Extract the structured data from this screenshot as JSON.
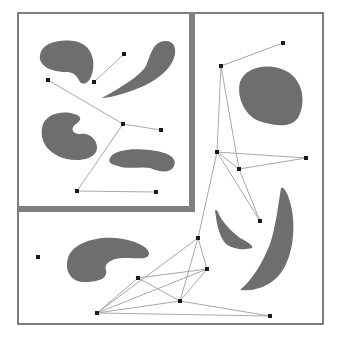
{
  "diagram": {
    "type": "probabilistic-roadmap",
    "colors": {
      "background": "#ffffff",
      "frame": "#555555",
      "inset_frame": "#808080",
      "obstacle": "#6e6e6e",
      "edge": "#a8a8a8",
      "node": "#1a1a1a"
    },
    "outer_frame": {
      "x": 18,
      "y": 13,
      "width": 305,
      "height": 311
    },
    "inset_frame": {
      "x": 18,
      "y": 13,
      "width": 171,
      "height": 193,
      "thickness": 6
    },
    "obstacles": [
      {
        "name": "inset-blob-top-left",
        "d": "M40,55 C42,42 62,38 78,42 C92,46 96,62 92,74 C90,82 84,86 80,82 C76,74 72,72 66,72 C52,72 38,66 40,55 Z"
      },
      {
        "name": "inset-feather",
        "d": "M102,98 C120,88 140,76 146,66 C150,56 152,46 160,42 C172,38 178,46 174,58 C168,74 150,84 134,90 C122,94 110,98 102,98 Z"
      },
      {
        "name": "inset-bean-left",
        "d": "M42,128 C44,114 62,110 74,114 C82,116 82,120 76,124 C70,128 72,134 80,134 C92,132 100,144 96,152 C90,162 70,162 58,156 C46,150 40,140 42,128 Z"
      },
      {
        "name": "inset-bean-right",
        "d": "M110,158 C114,150 132,148 150,150 C168,152 178,158 174,166 C170,174 160,172 150,168 C140,166 128,170 118,166 C110,164 108,162 110,158 Z"
      },
      {
        "name": "upper-right-egg",
        "d": "M240,82 C246,66 270,62 288,72 C304,82 306,104 298,118 C290,128 276,126 262,122 C246,118 236,98 240,82 Z"
      },
      {
        "name": "lower-left-kidney",
        "d": "M68,258 C72,244 94,236 116,238 C136,240 150,248 149,254 C148,260 138,258 126,258 C110,258 104,264 106,270 C108,280 96,282 84,282 C72,282 64,272 68,258 Z"
      },
      {
        "name": "small-crescent",
        "d": "M215,210 C216,218 218,236 226,244 C234,250 246,250 252,248 C254,246 248,242 240,238 C230,230 222,222 218,212 C217,210 216,210 215,210 Z"
      },
      {
        "name": "large-crescent",
        "d": "M281,188 C278,206 276,226 270,244 C262,264 252,280 240,290 C254,292 274,286 284,268 C294,250 296,222 290,202 C288,194 284,186 281,188 Z"
      }
    ],
    "nodes": [
      {
        "id": "n1",
        "x": 124,
        "y": 54
      },
      {
        "id": "n2",
        "x": 94,
        "y": 82
      },
      {
        "id": "n3",
        "x": 48,
        "y": 80
      },
      {
        "id": "n4",
        "x": 123,
        "y": 124
      },
      {
        "id": "n5",
        "x": 161,
        "y": 130
      },
      {
        "id": "n6",
        "x": 77,
        "y": 191
      },
      {
        "id": "n7",
        "x": 156,
        "y": 192
      },
      {
        "id": "n8",
        "x": 283,
        "y": 43
      },
      {
        "id": "n9",
        "x": 221,
        "y": 66
      },
      {
        "id": "n10",
        "x": 217,
        "y": 152
      },
      {
        "id": "n11",
        "x": 239,
        "y": 169
      },
      {
        "id": "n12",
        "x": 306,
        "y": 158
      },
      {
        "id": "n13",
        "x": 260,
        "y": 221
      },
      {
        "id": "n14",
        "x": 38,
        "y": 257
      },
      {
        "id": "n15",
        "x": 198,
        "y": 238
      },
      {
        "id": "n16",
        "x": 207,
        "y": 269
      },
      {
        "id": "n17",
        "x": 138,
        "y": 278
      },
      {
        "id": "n18",
        "x": 180,
        "y": 301
      },
      {
        "id": "n19",
        "x": 97,
        "y": 313
      },
      {
        "id": "n20",
        "x": 270,
        "y": 316
      }
    ],
    "edges": [
      [
        "n1",
        "n2"
      ],
      [
        "n3",
        "n4"
      ],
      [
        "n4",
        "n5"
      ],
      [
        "n4",
        "n6"
      ],
      [
        "n6",
        "n7"
      ],
      [
        "n8",
        "n9"
      ],
      [
        "n9",
        "n10"
      ],
      [
        "n9",
        "n11"
      ],
      [
        "n11",
        "n13"
      ],
      [
        "n10",
        "n13"
      ],
      [
        "n10",
        "n11"
      ],
      [
        "n10",
        "n12"
      ],
      [
        "n11",
        "n12"
      ],
      [
        "n10",
        "n15"
      ],
      [
        "n15",
        "n16"
      ],
      [
        "n15",
        "n19"
      ],
      [
        "n15",
        "n18"
      ],
      [
        "n16",
        "n17"
      ],
      [
        "n16",
        "n18"
      ],
      [
        "n16",
        "n19"
      ],
      [
        "n17",
        "n19"
      ],
      [
        "n17",
        "n18"
      ],
      [
        "n18",
        "n19"
      ],
      [
        "n18",
        "n20"
      ],
      [
        "n19",
        "n20"
      ]
    ]
  }
}
